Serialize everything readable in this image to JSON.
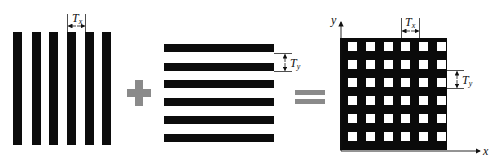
{
  "diagram": {
    "colors": {
      "pattern": "#0c0c0c",
      "operator": "#8a8a8a",
      "background": "#ffffff"
    },
    "panel_vertical": {
      "stripe_count": 6,
      "period_label": "T",
      "period_subscript": "x"
    },
    "operator_plus": "+",
    "panel_horizontal": {
      "bar_count": 6,
      "period_label": "T",
      "period_subscript": "y"
    },
    "operator_equals": "=",
    "panel_grid": {
      "rows": 6,
      "cols": 6,
      "x_axis_label": "x",
      "y_axis_label": "y",
      "period_x_label": "T",
      "period_x_subscript": "x",
      "period_y_label": "T",
      "period_y_subscript": "y"
    }
  }
}
